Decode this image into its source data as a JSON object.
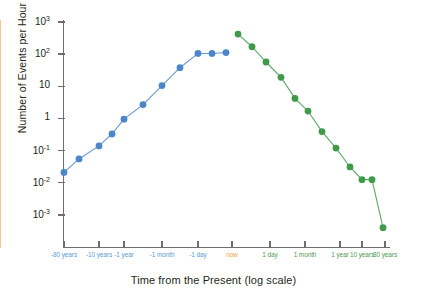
{
  "chart_data": {
    "type": "line",
    "title": "",
    "xlabel": "Time from the Present (log scale)",
    "ylabel": "Number of Events per Hour",
    "yscale": "log",
    "xscale": "symlog",
    "ylim": [
      0.0002,
      1000
    ],
    "grid": false,
    "legend": null,
    "annotations": [
      {
        "name": "now-divider",
        "label": "now",
        "color": "#e8a33d",
        "x_label": "now"
      }
    ],
    "y_ticks": [
      {
        "value": 1000,
        "label": "10",
        "exponent": "3"
      },
      {
        "value": 100,
        "label": "10",
        "exponent": "2"
      },
      {
        "value": 10,
        "label": "10",
        "exponent": ""
      },
      {
        "value": 1,
        "label": "1",
        "exponent": ""
      },
      {
        "value": 0.1,
        "label": "10",
        "exponent": "-1"
      },
      {
        "value": 0.01,
        "label": "10",
        "exponent": "-2"
      },
      {
        "value": 0.001,
        "label": "10",
        "exponent": "-3"
      }
    ],
    "x_ticks": [
      {
        "label": "-80 years",
        "side": "past"
      },
      {
        "label": "-10 years",
        "side": "past"
      },
      {
        "label": "-1 year",
        "side": "past"
      },
      {
        "label": "-1 month",
        "side": "past"
      },
      {
        "label": "-1 day",
        "side": "past"
      },
      {
        "label": "now",
        "side": "now"
      },
      {
        "label": "1 day",
        "side": "future"
      },
      {
        "label": "1 month",
        "side": "future"
      },
      {
        "label": "1 year",
        "side": "future"
      },
      {
        "label": "10 years",
        "side": "future"
      },
      {
        "label": "80 years",
        "side": "future"
      }
    ],
    "series": [
      {
        "name": "Past events",
        "color": "#4a86c8",
        "marker": "circle",
        "x": [
          "-80 years",
          "-30 years",
          "-10 years",
          "-3 years",
          "-1 year",
          "-3 months",
          "-1 month",
          "-1 week",
          "-1 day",
          "-3 hours",
          "-1 hour"
        ],
        "values": [
          0.021,
          0.055,
          0.14,
          0.33,
          0.95,
          2.7,
          10.5,
          38,
          105,
          105,
          112
        ]
      },
      {
        "name": "Future events",
        "color": "#3f9a4a",
        "marker": "circle",
        "x": [
          "1 hour",
          "3 hours",
          "1 day",
          "1 week",
          "1 month",
          "3 months",
          "1 year",
          "3 years",
          "10 years",
          "30 years",
          "60 years",
          "80 years"
        ],
        "values": [
          420,
          170,
          57,
          19,
          4.2,
          1.7,
          0.39,
          0.12,
          0.031,
          0.0125,
          0.0125,
          0.0004
        ]
      }
    ]
  }
}
